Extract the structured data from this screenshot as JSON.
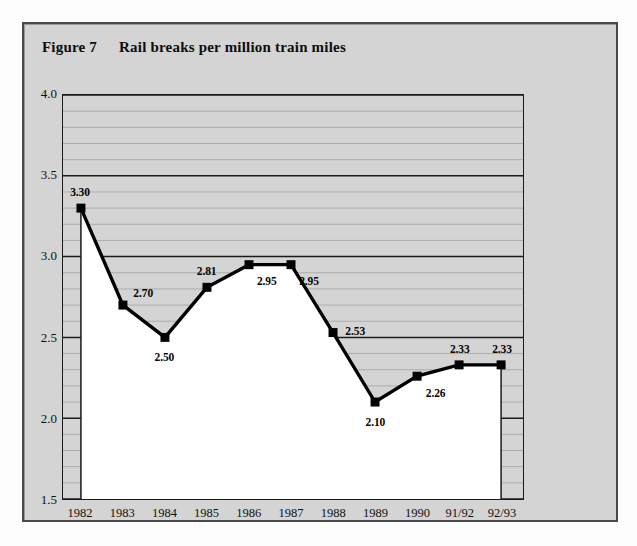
{
  "figure": {
    "number_label": "Figure 7",
    "title": "Rail breaks per million train miles",
    "panel_bg": "#d4d4d4",
    "border_color": "#4a4a4a"
  },
  "chart_data": {
    "type": "line",
    "title": "Rail breaks per million train miles",
    "xlabel": "",
    "ylabel": "",
    "categories": [
      "1982",
      "1983",
      "1984",
      "1985",
      "1986",
      "1987",
      "1988",
      "1989",
      "1990",
      "91/92",
      "92/93"
    ],
    "values": [
      3.3,
      2.7,
      2.5,
      2.81,
      2.95,
      2.95,
      2.53,
      2.1,
      2.26,
      2.33,
      2.33
    ],
    "point_labels": [
      "3.30",
      "2.70",
      "2.50",
      "2.81",
      "2.95",
      "2.95",
      "2.53",
      "2.10",
      "2.26",
      "2.33",
      "2.33"
    ],
    "label_placement": [
      "above",
      "above-right",
      "below",
      "above",
      "below-right",
      "below-right",
      "right",
      "below",
      "below-right",
      "above",
      "above"
    ],
    "ylim": [
      1.5,
      4.0
    ],
    "y_ticks": [
      "1.5",
      "2.0",
      "2.5",
      "3.0",
      "3.5",
      "4.0"
    ],
    "y_tick_values": [
      1.5,
      2.0,
      2.5,
      3.0,
      3.5,
      4.0
    ],
    "y_minor_step": 0.1,
    "grid": true,
    "grid_major_color": "#1a1a1a",
    "grid_minor_color": "#a8a8a8",
    "legend": null,
    "series_color": "#000000",
    "marker": "square",
    "area_fill_color": "#ffffff",
    "plot_bg": "#d4d4d4"
  }
}
